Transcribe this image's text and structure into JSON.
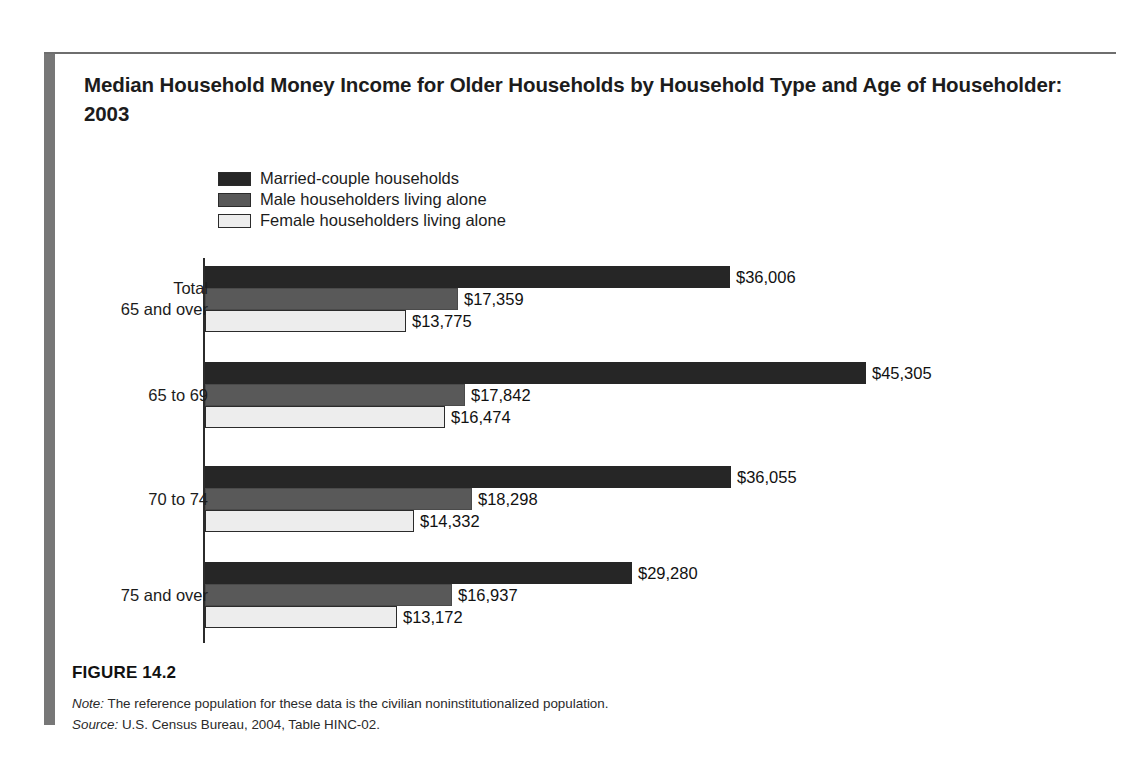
{
  "figure": {
    "title": "Median Household Money Income for Older Households by Household Type and Age of Householder: 2003",
    "caption": "FIGURE 14.2",
    "note_label": "Note:",
    "note_text": " The reference population for these data is the civilian noninstitutionalized population.",
    "source_label": "Source:",
    "source_text": " U.S. Census Bureau, 2004, Table HINC-02."
  },
  "legend": {
    "items": [
      {
        "label": "Married-couple households",
        "color": "#262626"
      },
      {
        "label": "Male householders living alone",
        "color": "#595959"
      },
      {
        "label": "Female householders living alone",
        "color": "#ededed"
      }
    ]
  },
  "chart_data": {
    "type": "bar",
    "orientation": "horizontal",
    "title": "Median Household Money Income for Older Households by Household Type and Age of Householder: 2003",
    "xlabel": "",
    "ylabel": "",
    "grid": false,
    "legend_position": "top-left",
    "xlim": [
      0,
      45305
    ],
    "categories": [
      "Total\n65 and over",
      "65 to 69",
      "70 to 74",
      "75 and over"
    ],
    "category_labels": [
      "Total 65 and over",
      "65 to 69",
      "70 to 74",
      "75 and over"
    ],
    "series": [
      {
        "name": "Married-couple households",
        "color": "#262626",
        "values": [
          36006,
          45305,
          36055,
          29280
        ],
        "labels": [
          "$36,006",
          "$45,305",
          "$36,055",
          "$29,280"
        ]
      },
      {
        "name": "Male householders living alone",
        "color": "#595959",
        "values": [
          17359,
          17842,
          18298,
          16937
        ],
        "labels": [
          "$17,359",
          "$17,842",
          "$18,298",
          "$16,937"
        ]
      },
      {
        "name": "Female householders living alone",
        "color": "#ededed",
        "values": [
          13775,
          16474,
          14332,
          13172
        ],
        "labels": [
          "$13,775",
          "$16,474",
          "$14,332",
          "$13,172"
        ]
      }
    ]
  }
}
